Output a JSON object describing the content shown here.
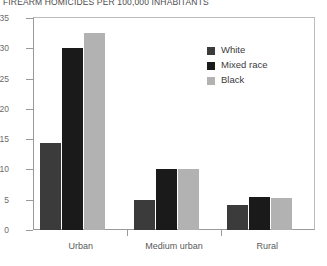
{
  "chart_data": {
    "type": "bar",
    "title": "FIREARM HOMICIDES PER 100,000 INHABITANTS",
    "xlabel": "",
    "ylabel": "",
    "categories": [
      "Urban",
      "Medium urban",
      "Rural"
    ],
    "series": [
      {
        "name": "White",
        "color": "#3b3b3b",
        "values": [
          14.3,
          5.0,
          4.2
        ]
      },
      {
        "name": "Mixed race",
        "color": "#1a1a1a",
        "values": [
          30.0,
          10.0,
          5.4
        ]
      },
      {
        "name": "Black",
        "color": "#b2b2b2",
        "values": [
          32.6,
          10.1,
          5.3
        ]
      }
    ],
    "ylim": [
      0,
      35
    ],
    "yticks": [
      0,
      5,
      10,
      15,
      20,
      25,
      30,
      35
    ],
    "ytick_labels": [
      "0",
      "5",
      "10",
      "15",
      "20",
      "25",
      "30",
      "35"
    ],
    "grid": false,
    "legend_position": "top-right",
    "legend_entries": [
      "White",
      "Mixed race",
      "Black"
    ]
  },
  "axis_colors": {
    "axis_line": "#9a9a9a",
    "frame_line": "#bbbbbb",
    "tick_text": "#6b6b6b",
    "category_text": "#5a5a5a",
    "title_text": "#4a4a4a",
    "legend_text": "#3c3c3c",
    "background": "#ffffff"
  }
}
